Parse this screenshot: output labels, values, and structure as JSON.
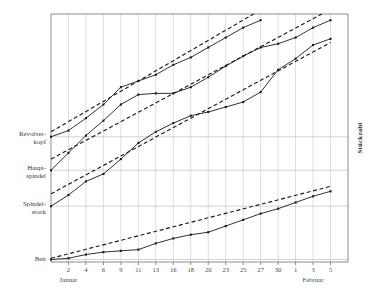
{
  "chart_data": {
    "type": "line",
    "title": "",
    "subtitle": "",
    "xlabel": "",
    "ylabel": "Stückzahl",
    "ylabel_position": "right",
    "grid": "vertical-and-horizontal",
    "legend": "none",
    "x_tick_labels": [
      "2",
      "4",
      "6",
      "9",
      "11",
      "13",
      "16",
      "18",
      "20",
      "23",
      "25",
      "27",
      "30",
      "1",
      "3",
      "5"
    ],
    "month_labels": [
      {
        "text": "Januar",
        "at_tick": "2"
      },
      {
        "text": "Februar",
        "at_tick": "3"
      }
    ],
    "y_category_labels": [
      {
        "line1": "Revolver-",
        "line2": "kopf"
      },
      {
        "line1": "Haupt-",
        "line2": "spindel"
      },
      {
        "line1": "Spindel-",
        "line2": "stock"
      },
      {
        "line1": "Bett",
        "line2": ""
      }
    ],
    "xlim": [
      0,
      17
    ],
    "ylim": [
      0,
      100
    ],
    "series": [
      {
        "name": "Revolverkopf",
        "style": "solid-with-markers",
        "baseline_label": "Revolver-kopf",
        "x": [
          0,
          1,
          2,
          3,
          4,
          5,
          6,
          7,
          8,
          9,
          10,
          11,
          12
        ],
        "values": [
          50.5,
          53.0,
          58.0,
          63.5,
          70.5,
          73.0,
          75.5,
          79.5,
          82.5,
          86.5,
          90.5,
          94.5,
          97.5
        ]
      },
      {
        "name": "Revolverkopf-Trend",
        "style": "dashed",
        "x": [
          0,
          11.6
        ],
        "values": [
          52.5,
          100.0
        ]
      },
      {
        "name": "Hauptspindel",
        "style": "solid-with-markers",
        "baseline_label": "Haupt-spindel",
        "x": [
          0,
          1,
          2,
          3,
          4,
          5,
          6,
          7,
          8,
          9,
          10,
          11,
          12,
          13,
          14,
          15,
          16
        ],
        "values": [
          37.0,
          44.0,
          51.0,
          57.0,
          63.5,
          67.5,
          68.0,
          68.0,
          70.5,
          74.5,
          79.0,
          83.0,
          86.5,
          88.0,
          90.5,
          94.5,
          97.5
        ]
      },
      {
        "name": "Hauptspindel-Trend",
        "style": "dashed",
        "x": [
          0,
          15.5
        ],
        "values": [
          41.5,
          100.0
        ]
      },
      {
        "name": "Spindelstock",
        "style": "solid-with-markers",
        "baseline_label": "Spindel-stock",
        "x": [
          0,
          1,
          2,
          3,
          4,
          5,
          6,
          7,
          8,
          9,
          10,
          11,
          12,
          13,
          14,
          15,
          16
        ],
        "values": [
          22.5,
          27.0,
          32.5,
          35.5,
          41.5,
          48.0,
          52.5,
          56.0,
          59.0,
          60.5,
          62.5,
          64.5,
          68.5,
          77.5,
          82.0,
          87.5,
          90.0
        ]
      },
      {
        "name": "Spindelstock-Trend",
        "style": "dashed",
        "x": [
          0,
          16
        ],
        "values": [
          27.5,
          88.5
        ]
      },
      {
        "name": "Bett",
        "style": "solid-with-markers",
        "baseline_label": "Bett",
        "x": [
          0,
          1,
          2,
          3,
          4,
          5,
          6,
          7,
          8,
          9,
          10,
          11,
          12,
          13,
          14,
          15,
          16
        ],
        "values": [
          1.0,
          1.5,
          3.0,
          4.0,
          4.5,
          5.0,
          7.5,
          9.5,
          11.0,
          12.0,
          14.5,
          17.0,
          19.5,
          21.5,
          24.0,
          26.5,
          28.5
        ]
      },
      {
        "name": "Bett-Trend",
        "style": "dashed",
        "x": [
          0,
          16
        ],
        "values": [
          1.5,
          30.5
        ]
      }
    ],
    "colors": {
      "series_line": "#1b1b1b",
      "trend_line": "#1b1b1b",
      "grid_vertical": "#c8c8c8",
      "grid_horizontal": "#b6b6b6",
      "axis": "#6e6e6e",
      "background": "#ffffff",
      "text": "#3a3a3a"
    }
  }
}
